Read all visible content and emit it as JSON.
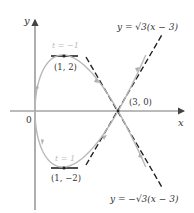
{
  "diagram": {
    "type": "parametric-curve",
    "axes": {
      "x_label": "x",
      "y_label": "y",
      "origin_label": "0"
    },
    "points": [
      {
        "label": "(1, 2)",
        "x": 1,
        "y": 2
      },
      {
        "label": "(1, −2)",
        "x": 1,
        "y": -2
      },
      {
        "label": "(3, 0)",
        "x": 3,
        "y": 0
      }
    ],
    "parameter_labels": [
      {
        "label": "t = −1"
      },
      {
        "label": "t = 1"
      }
    ],
    "tangent_lines": [
      {
        "label": "y = √3(x − 3)"
      },
      {
        "label": "y = −√3(x − 3)"
      }
    ],
    "colors": {
      "curve": "#b5b5b5",
      "axes": "#555555",
      "tangent": "#222222",
      "parameter_text": "#bdbdbd"
    }
  }
}
